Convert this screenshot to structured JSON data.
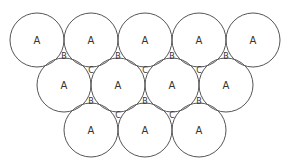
{
  "diagram": {
    "type": "circle-packing",
    "radius": 27,
    "stroke_color": "#555555",
    "text_color": "#333333",
    "circles": [
      {
        "cx": 37,
        "cy": 40,
        "label": "A"
      },
      {
        "cx": 91,
        "cy": 40,
        "label": "A"
      },
      {
        "cx": 145,
        "cy": 40,
        "label": "A"
      },
      {
        "cx": 199,
        "cy": 40,
        "label": "A"
      },
      {
        "cx": 253,
        "cy": 40,
        "label": "A"
      },
      {
        "cx": 64,
        "cy": 85,
        "label": "A"
      },
      {
        "cx": 118,
        "cy": 85,
        "label": "A"
      },
      {
        "cx": 172,
        "cy": 85,
        "label": "A"
      },
      {
        "cx": 226,
        "cy": 85,
        "label": "A"
      },
      {
        "cx": 91,
        "cy": 130,
        "label": "A"
      },
      {
        "cx": 145,
        "cy": 130,
        "label": "A"
      },
      {
        "cx": 199,
        "cy": 130,
        "label": "A"
      }
    ],
    "gap_labels": [
      {
        "x": 64,
        "y": 56,
        "label": "B"
      },
      {
        "x": 118,
        "y": 56,
        "label": "B"
      },
      {
        "x": 172,
        "y": 56,
        "label": "B"
      },
      {
        "x": 226,
        "y": 56,
        "label": "B"
      },
      {
        "x": 91,
        "y": 70,
        "label": "C"
      },
      {
        "x": 145,
        "y": 70,
        "label": "C"
      },
      {
        "x": 199,
        "y": 70,
        "label": "C"
      },
      {
        "x": 91,
        "y": 101,
        "label": "B"
      },
      {
        "x": 145,
        "y": 101,
        "label": "B"
      },
      {
        "x": 199,
        "y": 101,
        "label": "B"
      },
      {
        "x": 118,
        "y": 115,
        "label": "C"
      },
      {
        "x": 172,
        "y": 115,
        "label": "C"
      }
    ]
  }
}
